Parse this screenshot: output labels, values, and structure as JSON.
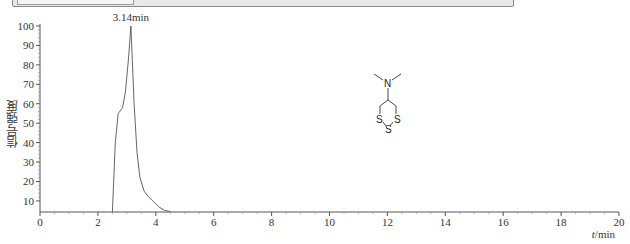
{
  "chart_data": {
    "type": "line",
    "title": "",
    "xlabel": "t/min",
    "xlabel_italic_part": "t",
    "xlabel_unit": "/min",
    "ylabel": "信号强度",
    "xlim": [
      0,
      20
    ],
    "ylim": [
      4.3,
      100
    ],
    "x_ticks": [
      0,
      2,
      4,
      6,
      8,
      10,
      12,
      14,
      16,
      18,
      20
    ],
    "y_ticks": [
      10,
      20,
      30,
      40,
      50,
      60,
      70,
      80,
      90,
      100
    ],
    "grid": false,
    "legend": null,
    "series": [
      {
        "name": "chromatogram",
        "x": [
          2.5,
          2.6,
          2.7,
          2.8,
          2.85,
          2.95,
          3.05,
          3.14,
          3.25,
          3.35,
          3.45,
          3.6,
          3.75,
          3.9,
          4.1,
          4.3,
          4.5
        ],
        "y": [
          4.3,
          40,
          55,
          57,
          58,
          66,
          82,
          100,
          60,
          35,
          22,
          15,
          12,
          10,
          7,
          5.2,
          4.5
        ]
      }
    ],
    "annotations": [
      {
        "text": "3.14min",
        "x": 3.14,
        "y": 100,
        "position": "above"
      }
    ],
    "inset_structure": {
      "description": "N,N-dimethyl-1,2,3-trithian-5-amine",
      "atoms": [
        "N",
        "S",
        "S",
        "S"
      ]
    }
  },
  "labels": {
    "peak": "3.14min",
    "xaxis_t": "t",
    "xaxis_unit": "/min",
    "yaxis": "信号强度",
    "atom_n": "N",
    "atom_s1": "S",
    "atom_s2": "S",
    "atom_s3": "S"
  }
}
